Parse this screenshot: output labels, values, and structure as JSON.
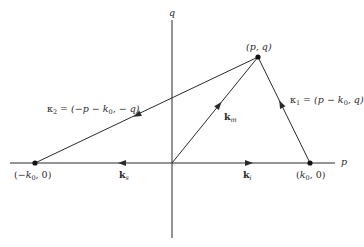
{
  "diagram": {
    "colors": {
      "line": "#2a2a2a",
      "background": "#ffffff"
    },
    "axes": {
      "horizontal": {
        "label": "p",
        "from": [
          10,
          163
        ],
        "to": [
          335,
          163
        ]
      },
      "vertical": {
        "label": "q",
        "from": [
          172,
          20
        ],
        "to": [
          172,
          238
        ]
      }
    },
    "points": [
      {
        "id": "pq",
        "label": "(p, q)",
        "x": 258,
        "y": 57
      },
      {
        "id": "neg_k0",
        "label": "(−k₀, 0)",
        "x": 35,
        "y": 163
      },
      {
        "id": "pos_k0",
        "label": "(k₀, 0)",
        "x": 310,
        "y": 163
      },
      {
        "id": "origin",
        "label": "",
        "x": 172,
        "y": 163
      }
    ],
    "vectors": [
      {
        "id": "k_m",
        "label": "k_m",
        "from": "origin",
        "to": "pq"
      },
      {
        "id": "k_i",
        "label": "k_i",
        "from": "origin",
        "to": "pos_k0"
      },
      {
        "id": "k_s",
        "label": "k_s",
        "from": "origin",
        "to": "neg_k0"
      },
      {
        "id": "kappa1",
        "label": "κ₁ = (p − k₀, q)",
        "from": "pos_k0",
        "to": "pq"
      },
      {
        "id": "kappa2",
        "label": "κ₂ = (−p − k₀, − q)",
        "from": "pq",
        "to": "neg_k0"
      }
    ],
    "labels": {
      "axis_p": "p",
      "axis_q": "q",
      "point_pq": "(p, q)",
      "point_neg_k0_open": "(−",
      "point_neg_k0_k": "k",
      "point_neg_k0_sub": "0",
      "point_neg_k0_close": ", 0)",
      "point_pos_k0_open": "(",
      "point_pos_k0_k": "k",
      "point_pos_k0_sub": "0",
      "point_pos_k0_close": ", 0)",
      "vec_km_k": "k",
      "vec_km_sub": "m",
      "vec_ki_k": "k",
      "vec_ki_sub": "i",
      "vec_ks_k": "k",
      "vec_ks_sub": "s",
      "kappa1_sym": "κ",
      "kappa1_sub": "1",
      "kappa1_eq": " = (p − k",
      "kappa1_sub0": "0",
      "kappa1_tail": ", q)",
      "kappa2_sym": "κ",
      "kappa2_sub": "2",
      "kappa2_eq": " = (−p − k",
      "kappa2_sub0": "0",
      "kappa2_tail": ", − q)"
    }
  }
}
